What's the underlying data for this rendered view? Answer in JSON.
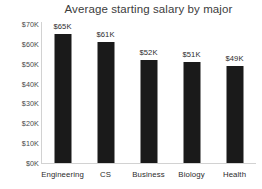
{
  "chart_data": {
    "type": "bar",
    "title": "Average starting salary by major",
    "xlabel": "",
    "ylabel": "",
    "categories": [
      "Engineering",
      "CS",
      "Business",
      "Biology",
      "Health"
    ],
    "values": [
      65000,
      61000,
      52000,
      51000,
      49000
    ],
    "data_labels": [
      "$65K",
      "$61K",
      "$52K",
      "$51K",
      "$49K"
    ],
    "ylim": [
      0,
      70000
    ],
    "ytick_values": [
      0,
      10000,
      20000,
      30000,
      40000,
      50000,
      60000,
      70000
    ],
    "ytick_labels": [
      "$0K",
      "$10K",
      "$20K",
      "$30K",
      "$40K",
      "$50K",
      "$60K",
      "$70K"
    ],
    "grid": false,
    "legend": null,
    "bar_color": "#1a1a1a",
    "background_color": "#ffffff",
    "axis_color": "#d2d2d2",
    "text_color": "#2b2b2b"
  }
}
